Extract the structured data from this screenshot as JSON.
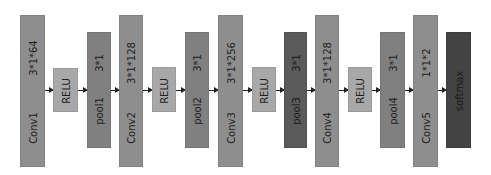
{
  "diagram": {
    "type": "cnn-architecture",
    "blocks": [
      {
        "id": "conv1",
        "name": "Conv1",
        "param": "3*1*64",
        "kind": "conv"
      },
      {
        "id": "relu1",
        "name": "RELU",
        "param": "",
        "kind": "relu"
      },
      {
        "id": "pool1",
        "name": "pool1",
        "param": "3*1",
        "kind": "pool"
      },
      {
        "id": "conv2",
        "name": "Conv2",
        "param": "3*1*128",
        "kind": "conv"
      },
      {
        "id": "relu2",
        "name": "RELU",
        "param": "",
        "kind": "relu"
      },
      {
        "id": "pool2",
        "name": "pool2",
        "param": "3*1",
        "kind": "pool"
      },
      {
        "id": "conv3",
        "name": "Conv3",
        "param": "3*1*256",
        "kind": "conv"
      },
      {
        "id": "relu3",
        "name": "RELU",
        "param": "",
        "kind": "relu"
      },
      {
        "id": "pool3",
        "name": "pool3",
        "param": "3*1",
        "kind": "pool-dark"
      },
      {
        "id": "conv4",
        "name": "Conv4",
        "param": "3*1*128",
        "kind": "conv"
      },
      {
        "id": "relu4",
        "name": "RELU",
        "param": "",
        "kind": "relu"
      },
      {
        "id": "pool4",
        "name": "pool4",
        "param": "3*1",
        "kind": "pool"
      },
      {
        "id": "conv5",
        "name": "Conv5",
        "param": "1*1*2",
        "kind": "conv"
      },
      {
        "id": "softmax",
        "name": "softmax",
        "param": "",
        "kind": "softmax"
      }
    ],
    "colors": {
      "conv": "#8e8e8e",
      "relu": "#a8a8a8",
      "pool": "#808080",
      "pool-dark": "#5a5a5a",
      "softmax": "#434343",
      "arrow": "#222222"
    }
  }
}
